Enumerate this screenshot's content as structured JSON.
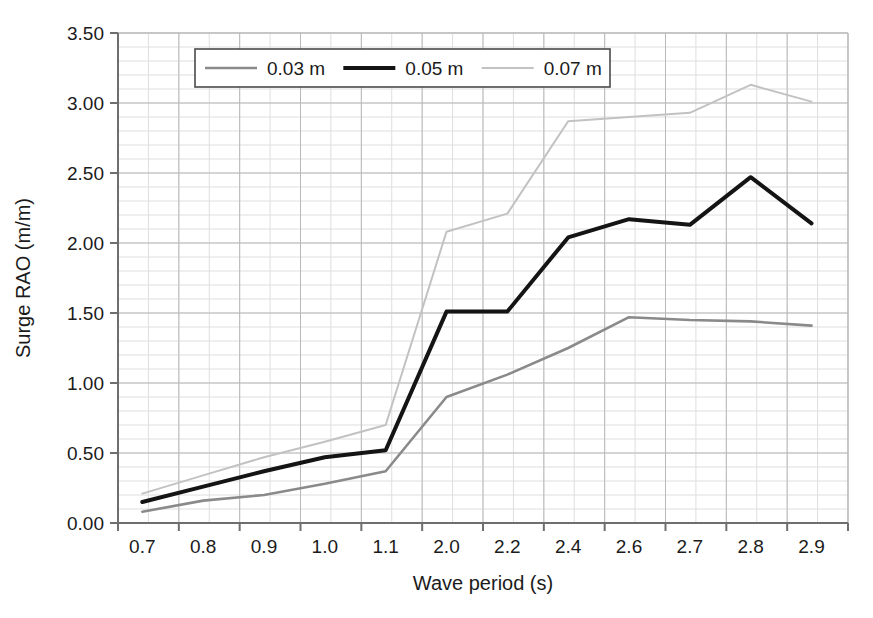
{
  "chart_data": {
    "type": "line",
    "title": "",
    "xlabel": "Wave period (s)",
    "ylabel": "Surge RAO (m/m)",
    "categories": [
      "0.7",
      "0.8",
      "0.9",
      "1.0",
      "1.1",
      "2.0",
      "2.2",
      "2.4",
      "2.6",
      "2.7",
      "2.8",
      "2.9"
    ],
    "ylim": [
      0.0,
      3.5
    ],
    "ytick_labels": [
      "0.00",
      "0.50",
      "1.00",
      "1.50",
      "2.00",
      "2.50",
      "3.00",
      "3.50"
    ],
    "ytick_values": [
      0.0,
      0.5,
      1.0,
      1.5,
      2.0,
      2.5,
      3.0,
      3.5
    ],
    "grid": true,
    "grid_minor": true,
    "legend_position": "top-center",
    "series": [
      {
        "name": "0.03 m",
        "color": "#8a8a8a",
        "width": 2.6,
        "values": [
          0.08,
          0.16,
          0.2,
          0.28,
          0.37,
          0.9,
          1.06,
          1.25,
          1.47,
          1.45,
          1.44,
          1.41
        ]
      },
      {
        "name": "0.05 m",
        "color": "#141414",
        "width": 4.0,
        "values": [
          0.15,
          0.26,
          0.37,
          0.47,
          0.52,
          1.51,
          1.51,
          2.04,
          2.17,
          2.13,
          2.47,
          2.14
        ]
      },
      {
        "name": "0.07 m",
        "color": "#c2c2c2",
        "width": 2.0,
        "values": [
          0.21,
          0.34,
          0.47,
          0.58,
          0.7,
          2.08,
          2.21,
          2.87,
          2.9,
          2.93,
          3.13,
          3.01
        ]
      }
    ]
  },
  "axes": {
    "x_title": "Wave period (s)",
    "y_title": "Surge RAO (m/m)"
  },
  "legend": {
    "entries": [
      {
        "label": "0.03 m"
      },
      {
        "label": "0.05 m"
      },
      {
        "label": "0.07 m"
      }
    ]
  },
  "colors": {
    "axis": "#6e6e6e",
    "grid_major": "#b9b9b9",
    "grid_minor": "#dedede",
    "text": "#1b1b1b",
    "legend_border": "#4a4a4a"
  },
  "geometry": {
    "plot_left": 118,
    "plot_right": 848,
    "plot_top": 33,
    "plot_bottom": 523
  }
}
